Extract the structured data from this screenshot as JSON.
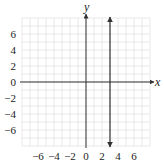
{
  "chart_data": {
    "type": "line",
    "title": "",
    "xlabel": "x",
    "ylabel": "y",
    "xlim": [
      -8,
      8
    ],
    "ylim": [
      -8,
      8
    ],
    "grid": true,
    "x_ticks": [
      -6,
      -4,
      -2,
      0,
      2,
      4,
      6
    ],
    "y_ticks": [
      6,
      4,
      2,
      0,
      -2,
      -4,
      -6
    ],
    "x_tick_labels": [
      "−6",
      "−4",
      "−2",
      "0",
      "2",
      "4",
      "6"
    ],
    "y_tick_labels": [
      "6",
      "4",
      "2",
      "0",
      "−2",
      "−4",
      "−6"
    ],
    "series": [
      {
        "name": "x = 3",
        "kind": "vertical-line",
        "x": [
          3,
          3
        ],
        "y": [
          -8,
          8
        ],
        "arrows": "both",
        "color": "#333333"
      }
    ],
    "colors": {
      "grid": "#e3e3e3",
      "axes": "#333333",
      "line": "#333333"
    }
  }
}
